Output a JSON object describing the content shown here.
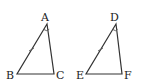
{
  "diagram": {
    "type": "geometry",
    "triangles": [
      {
        "name": "triangle-ABC",
        "vertices": {
          "A": {
            "label": "A",
            "x": 47,
            "y": 24,
            "lx": 41,
            "ly": 21
          },
          "B": {
            "label": "B",
            "x": 17,
            "y": 74,
            "lx": 6,
            "ly": 79
          },
          "C": {
            "label": "C",
            "x": 54,
            "y": 74,
            "lx": 56,
            "ly": 79
          }
        },
        "tick_on_side": "AB",
        "angle_mark_at": "A"
      },
      {
        "name": "triangle-DEF",
        "vertices": {
          "D": {
            "label": "D",
            "x": 116,
            "y": 24,
            "lx": 110,
            "ly": 21
          },
          "E": {
            "label": "E",
            "x": 86,
            "y": 74,
            "lx": 76,
            "ly": 79
          },
          "F": {
            "label": "F",
            "x": 122,
            "y": 74,
            "lx": 124,
            "ly": 79
          }
        },
        "tick_on_side": "DE",
        "angle_mark_at": "D"
      }
    ],
    "colors": {
      "stroke": "#333333",
      "text": "#222222",
      "background": "#ffffff"
    }
  }
}
